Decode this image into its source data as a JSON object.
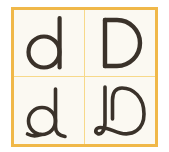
{
  "figure": {
    "kind": "letterform-comparison-grid",
    "rows": 2,
    "columns": 2,
    "background_color": "#fbf9f2",
    "outer_background_color": "#ffffff",
    "frame_color": "#f0b849",
    "divider_color": "#f7d98a",
    "stroke_color": "#3a322a"
  },
  "cells": [
    {
      "position": "top-left",
      "character": "d",
      "case": "lowercase",
      "style": "geometric-sans",
      "orientation": "upright",
      "icon": "letter-lowercase-d-icon"
    },
    {
      "position": "top-right",
      "character": "D",
      "case": "uppercase",
      "style": "geometric-sans",
      "orientation": "upright",
      "icon": "letter-uppercase-d-icon"
    },
    {
      "position": "bottom-left",
      "character": "d",
      "case": "lowercase",
      "style": "rounded-monoline-with-flare",
      "orientation": "upright",
      "icon": "letter-lowercase-d-script-icon"
    },
    {
      "position": "bottom-right",
      "character": "D",
      "case": "uppercase",
      "style": "cursive-looped-script",
      "orientation": "upright",
      "icon": "letter-uppercase-d-script-icon"
    }
  ]
}
